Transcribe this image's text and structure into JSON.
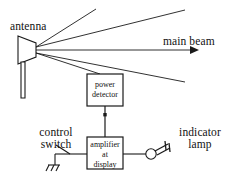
{
  "diagram": {
    "stroke_color": "#1a1a1a",
    "background_color": "#ffffff",
    "labels": {
      "antenna": "antenna",
      "main_beam": "main beam",
      "control_switch_line1": "control",
      "control_switch_line2": "switch",
      "indicator_lamp_line1": "indicator",
      "indicator_lamp_line2": "lamp"
    },
    "blocks": [
      {
        "id": "power-detector",
        "lines": [
          "power",
          "detector"
        ],
        "x": 87,
        "y": 74,
        "width": 36,
        "height": 32
      },
      {
        "id": "amplifier-at-display",
        "lines": [
          "amplifier",
          "at",
          "display"
        ],
        "x": 87,
        "y": 137,
        "width": 36,
        "height": 32
      }
    ],
    "beams": [
      {
        "id": "upper-beam-outer",
        "x1": 36,
        "y1": 47,
        "x2": 96,
        "y2": 9
      },
      {
        "id": "upper-beam-inner",
        "x1": 36,
        "y1": 47,
        "x2": 185,
        "y2": 10
      },
      {
        "id": "main-beam-axis",
        "x1": 36,
        "y1": 50,
        "x2": 197,
        "y2": 50
      },
      {
        "id": "lower-beam-inner",
        "x1": 36,
        "y1": 53,
        "x2": 100,
        "y2": 74
      },
      {
        "id": "lower-beam-outer",
        "x1": 36,
        "y1": 53,
        "x2": 185,
        "y2": 82
      }
    ],
    "icons": {
      "antenna": "horn-antenna-icon",
      "main_beam_arrow": "arrow-right-icon",
      "ground": "ground-symbol-icon",
      "switch": "switch-symbol-icon",
      "lamp": "indicator-lamp-icon"
    },
    "connections": [
      {
        "id": "detector-to-amplifier",
        "from": "power-detector",
        "to": "amplifier-at-display"
      },
      {
        "id": "switch-to-amplifier",
        "from": "control-switch",
        "to": "amplifier-at-display"
      },
      {
        "id": "amplifier-to-lamp",
        "from": "amplifier-at-display",
        "to": "indicator-lamp"
      }
    ]
  }
}
